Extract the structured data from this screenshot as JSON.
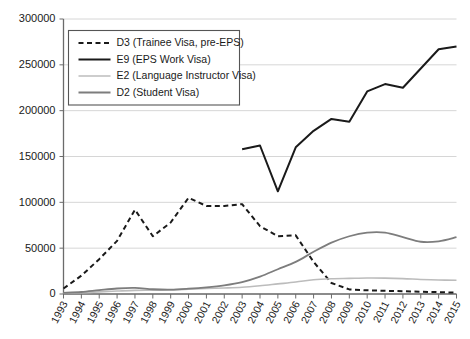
{
  "chart_data": {
    "type": "line",
    "title": "",
    "xlabel": "",
    "ylabel": "",
    "grid": true,
    "legend_position": "top-left",
    "x": [
      1993,
      1994,
      1995,
      1996,
      1997,
      1998,
      1999,
      2000,
      2001,
      2002,
      2003,
      2004,
      2005,
      2006,
      2007,
      2008,
      2009,
      2010,
      2011,
      2012,
      2013,
      2014,
      2015
    ],
    "categories": [
      "1993",
      "1994",
      "1995",
      "1996",
      "1997",
      "1998",
      "1999",
      "2000",
      "2001",
      "2002",
      "2003",
      "2004",
      "2005",
      "2006",
      "2007",
      "2008",
      "2009",
      "2010",
      "2011",
      "2012",
      "2013",
      "2014",
      "2015"
    ],
    "ylim": [
      0,
      300000
    ],
    "yticks": [
      0,
      50000,
      100000,
      150000,
      200000,
      250000,
      300000
    ],
    "ytick_labels": [
      "0",
      "50000",
      "100000",
      "150000",
      "200000",
      "250000",
      "300000"
    ],
    "series": [
      {
        "name": "D3 (Trainee Visa, pre-EPS)",
        "key": "D3",
        "style": "dashed",
        "color": "#1a1a1a",
        "width": 2.0,
        "dash": "5,3.5",
        "values": [
          6000,
          20000,
          38000,
          58000,
          92000,
          63000,
          78000,
          105000,
          96000,
          96000,
          98000,
          74000,
          63000,
          64000,
          35000,
          12000,
          5000,
          4000,
          3500,
          3000,
          2500,
          2000,
          1500
        ]
      },
      {
        "name": "E9 (EPS Work Visa)",
        "key": "E9",
        "style": "solid",
        "color": "#1a1a1a",
        "width": 2.0,
        "dash": "",
        "values": [
          null,
          null,
          null,
          null,
          null,
          null,
          null,
          null,
          null,
          null,
          158000,
          162000,
          112000,
          160000,
          178000,
          191000,
          188000,
          221000,
          229000,
          225000,
          246000,
          267000,
          270000
        ]
      },
      {
        "name": "E2 (Language Instructor Visa)",
        "key": "E2",
        "style": "solid",
        "color": "#bcbcbc",
        "width": 1.6,
        "dash": "",
        "values": [
          900,
          1400,
          2300,
          3200,
          4000,
          4200,
          4500,
          5200,
          6000,
          6600,
          7400,
          9000,
          11000,
          13000,
          15500,
          16600,
          17000,
          17400,
          17300,
          16800,
          15900,
          15300,
          15000
        ]
      },
      {
        "name": "D2 (Student Visa)",
        "key": "D2",
        "style": "solid",
        "color": "#7d7d7d",
        "width": 1.8,
        "dash": "",
        "values": [
          1200,
          2200,
          4200,
          6000,
          6600,
          5200,
          4800,
          5800,
          7300,
          9500,
          13000,
          19000,
          27000,
          35000,
          46000,
          56000,
          63000,
          67000,
          67000,
          62000,
          57000,
          57500,
          62000
        ]
      }
    ]
  },
  "legend": {
    "items": [
      {
        "label": "D3 (Trainee Visa, pre-EPS)"
      },
      {
        "label": "E9 (EPS Work Visa)"
      },
      {
        "label": "E2 (Language Instructor Visa)"
      },
      {
        "label": "D2 (Student Visa)"
      }
    ]
  }
}
